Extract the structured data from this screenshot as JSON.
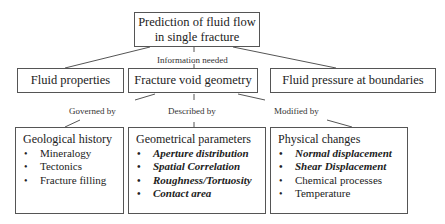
{
  "root": {
    "line1": "Prediction of fluid flow",
    "line2": "in single fracture"
  },
  "labels": {
    "info": "Information needed",
    "governed": "Governed by",
    "described": "Described by",
    "modified": "Modified by"
  },
  "level2": {
    "fluid_properties": "Fluid properties",
    "fracture_void_geometry": "Fracture void geometry",
    "fluid_pressure": "Fluid pressure at boundaries"
  },
  "level3": {
    "geological": {
      "title": "Geological history",
      "items": [
        "Mineralogy",
        "Tectonics",
        "Fracture filling"
      ]
    },
    "geometrical": {
      "title": "Geometrical parameters",
      "items": [
        "Aperture distribution",
        "Spatial Correlation",
        "Roughness/Tortuosity",
        "Contact area"
      ]
    },
    "physical": {
      "title": "Physical changes",
      "items": [
        "Normal displacement",
        "Shear Displacement",
        "Chemical processes",
        "Temperature"
      ]
    }
  }
}
